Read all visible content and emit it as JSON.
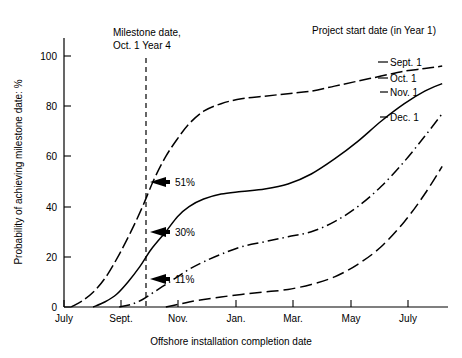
{
  "chart_data": {
    "type": "line",
    "title": "",
    "xlabel": "Offshore installation completion date",
    "ylabel": "Probability of achieving milestone date: %",
    "xticklabels": [
      "July",
      "Sept.",
      "Nov.",
      "Jan.",
      "Mar.",
      "May",
      "July"
    ],
    "yticklabels": [
      "0",
      "20",
      "40",
      "60",
      "80",
      "100"
    ],
    "yticks": [
      0,
      20,
      40,
      60,
      80,
      100
    ],
    "ylim": [
      0,
      108
    ],
    "xlim": [
      0,
      13.2
    ],
    "grid": false,
    "legend_position": "right-of-curve-ends",
    "legend_title": "Project start date (in Year 1)",
    "series": [
      {
        "name": "Sept. 1",
        "style": "long-dash",
        "points": [
          [
            0.25,
            0
          ],
          [
            0.7,
            3
          ],
          [
            1.1,
            7
          ],
          [
            1.5,
            13
          ],
          [
            1.9,
            21
          ],
          [
            2.3,
            30
          ],
          [
            2.7,
            40
          ],
          [
            3.1,
            51
          ],
          [
            3.5,
            60
          ],
          [
            3.9,
            67
          ],
          [
            4.3,
            73
          ],
          [
            4.8,
            78
          ],
          [
            5.4,
            81
          ],
          [
            6.1,
            83
          ],
          [
            6.9,
            84
          ],
          [
            7.7,
            85
          ],
          [
            8.5,
            86
          ],
          [
            9.3,
            88
          ],
          [
            10.1,
            90
          ],
          [
            10.9,
            92
          ],
          [
            11.7,
            94
          ],
          [
            12.4,
            95
          ],
          [
            13.0,
            96
          ]
        ]
      },
      {
        "name": "Oct. 1",
        "style": "solid",
        "points": [
          [
            1.0,
            0
          ],
          [
            1.4,
            2
          ],
          [
            1.8,
            5
          ],
          [
            2.2,
            10
          ],
          [
            2.6,
            16
          ],
          [
            3.0,
            23
          ],
          [
            3.5,
            30
          ],
          [
            3.9,
            36
          ],
          [
            4.3,
            40
          ],
          [
            4.8,
            43
          ],
          [
            5.4,
            45
          ],
          [
            6.1,
            46
          ],
          [
            6.9,
            47
          ],
          [
            7.7,
            49
          ],
          [
            8.5,
            53
          ],
          [
            9.3,
            59
          ],
          [
            10.1,
            66
          ],
          [
            10.9,
            74
          ],
          [
            11.7,
            81
          ],
          [
            12.4,
            86
          ],
          [
            13.0,
            89
          ]
        ]
      },
      {
        "name": "Nov. 1",
        "style": "dash-dot",
        "points": [
          [
            1.9,
            0
          ],
          [
            2.3,
            1
          ],
          [
            2.7,
            3
          ],
          [
            3.1,
            6
          ],
          [
            3.5,
            9
          ],
          [
            3.9,
            12
          ],
          [
            4.3,
            15
          ],
          [
            4.8,
            18
          ],
          [
            5.4,
            21
          ],
          [
            6.1,
            24
          ],
          [
            6.9,
            26
          ],
          [
            7.7,
            28
          ],
          [
            8.5,
            30
          ],
          [
            9.3,
            34
          ],
          [
            10.1,
            40
          ],
          [
            10.9,
            48
          ],
          [
            11.7,
            58
          ],
          [
            12.4,
            68
          ],
          [
            13.0,
            77
          ]
        ]
      },
      {
        "name": "Dec. 1",
        "style": "long-dash",
        "points": [
          [
            3.5,
            0
          ],
          [
            3.9,
            1
          ],
          [
            4.3,
            2
          ],
          [
            4.8,
            3
          ],
          [
            5.4,
            4
          ],
          [
            6.1,
            5
          ],
          [
            6.9,
            6
          ],
          [
            7.7,
            7
          ],
          [
            8.5,
            9
          ],
          [
            9.3,
            12
          ],
          [
            10.1,
            17
          ],
          [
            10.9,
            24
          ],
          [
            11.7,
            34
          ],
          [
            12.4,
            45
          ],
          [
            13.0,
            56
          ]
        ]
      }
    ],
    "annotations": [
      {
        "label": "51%",
        "x": 3.1,
        "y": 51,
        "series": "Sept. 1"
      },
      {
        "label": "30%",
        "x": 3.1,
        "y": 30,
        "series": "Oct. 1"
      },
      {
        "label": "11%",
        "x": 3.1,
        "y": 11,
        "series": "Nov. 1"
      }
    ],
    "reference_line": {
      "label_line1": "Milestone date,",
      "label_line2": "Oct. 1 Year 4",
      "x": 3.1,
      "style": "dashed-vertical"
    }
  }
}
